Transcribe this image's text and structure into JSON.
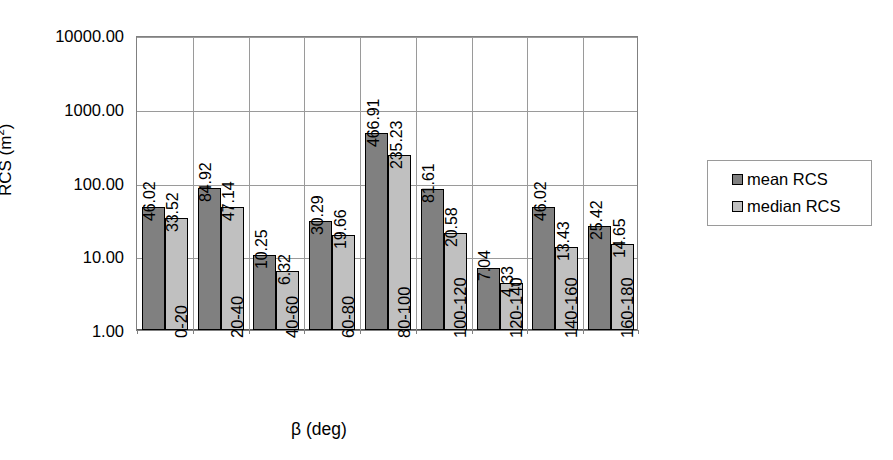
{
  "chart_data": {
    "type": "bar",
    "title": "",
    "xlabel": "β (deg)",
    "ylabel": "RCS (m²)",
    "yscale": "log",
    "ylim": [
      1,
      10000
    ],
    "ytick_labels": [
      "1.00",
      "10.00",
      "100.00",
      "1000.00",
      "10000.00"
    ],
    "ytick_values": [
      1,
      10,
      100,
      1000,
      10000
    ],
    "grid": true,
    "legend_position": "right",
    "categories": [
      "0-20",
      "20-40",
      "40-60",
      "60-80",
      "80-100",
      "100-120",
      "120-140",
      "140-160",
      "160-180"
    ],
    "series": [
      {
        "name": "mean RCS",
        "color": "#808080",
        "values": [
          46.02,
          84.92,
          10.25,
          30.29,
          466.91,
          81.61,
          7.04,
          46.02,
          25.42
        ],
        "labels": [
          "46.02",
          "84.92",
          "10.25",
          "30.29",
          "466.91",
          "81.61",
          "7.04",
          "46.02",
          "25.42"
        ]
      },
      {
        "name": "median RCS",
        "color": "#c0c0c0",
        "values": [
          33.52,
          47.14,
          6.32,
          19.66,
          235.23,
          20.58,
          4.33,
          13.43,
          14.65
        ],
        "labels": [
          "33.52",
          "47.14",
          "6.32",
          "19.66",
          "235.23",
          "20.58",
          "4.33",
          "13.43",
          "14.65"
        ]
      }
    ]
  },
  "axis_titles": {
    "y_prefix": "RCS (m",
    "y_sup": "2",
    "y_suffix": ")",
    "x": "β (deg)"
  }
}
